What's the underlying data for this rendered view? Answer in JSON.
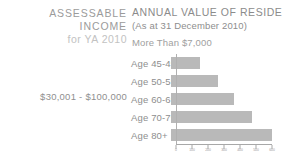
{
  "left_panel": {
    "heading_line1": "ASSESSABLE",
    "heading_line2": "INCOME",
    "year_label": "for YA 2010",
    "income_range": "$30,001 - $100,000"
  },
  "right_panel": {
    "title": "ANNUAL VALUE OF RESIDENCE",
    "subtitle": "(As at 31 December 2010)",
    "band_label": "More Than $7,000"
  },
  "colors": {
    "bar": "#b9b9b9",
    "axis": "#a8a8a8",
    "heading_text": "#9b9b9b",
    "year_text": "#c2c2c2",
    "body_text": "#8e8e8e",
    "background": "#ffffff"
  },
  "chart_data": {
    "type": "bar",
    "orientation": "horizontal",
    "title": "ANNUAL VALUE OF RESIDENCE",
    "subtitle": "(As at 31 December 2010)",
    "band_label": "More Than $7,000",
    "xlabel": "",
    "ylabel": "",
    "categories": [
      "Age 45-49",
      "Age 50-59",
      "Age 60-69",
      "Age 70-79",
      "Age 80+"
    ],
    "values": [
      175,
      280,
      375,
      480,
      600
    ],
    "xlim": [
      0,
      600
    ],
    "xticks": [
      0,
      100,
      200,
      300,
      400,
      500,
      600
    ],
    "xtick_labels": [
      "0",
      "100",
      "200",
      "300",
      "400",
      "500",
      "600"
    ],
    "grid": false,
    "legend": false
  }
}
